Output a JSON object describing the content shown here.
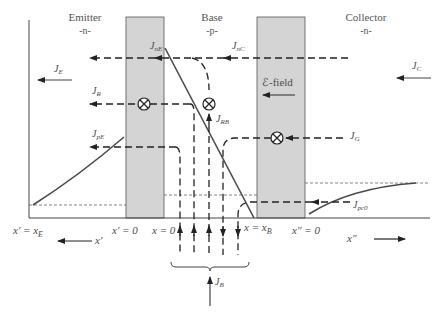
{
  "regions": {
    "emitter": {
      "name": "Emitter",
      "type": "-n-"
    },
    "base": {
      "name": "Base",
      "type": "-p-"
    },
    "collector": {
      "name": "Collector",
      "type": "-n-"
    }
  },
  "currents": {
    "JE": {
      "main": "J",
      "sub": "E"
    },
    "JnE": {
      "main": "J",
      "sub": "nE"
    },
    "JnC": {
      "main": "J",
      "sub": "nC"
    },
    "JC": {
      "main": "J",
      "sub": "C"
    },
    "JR": {
      "main": "J",
      "sub": "R"
    },
    "JRB": {
      "main": "J",
      "sub": "RB"
    },
    "JpE": {
      "main": "J",
      "sub": "pE"
    },
    "JG": {
      "main": "J",
      "sub": "G"
    },
    "Jpc0": {
      "main": "J",
      "sub": "pc0"
    },
    "JB": {
      "main": "J",
      "sub": "B"
    }
  },
  "field_label": "ℰ-field",
  "axis_labels": {
    "x_prime_eq_xE": "x′ = x",
    "x_prime_eq_xE_sub": "E",
    "x_prime_eq_0": "x′ = 0",
    "x_eq_0": "x = 0",
    "x_eq_xB": "x = x",
    "x_eq_xB_sub": "B",
    "x_dprime_eq_0": "x″ = 0",
    "x_prime_dir": "x′",
    "x_dprime_dir": "x″"
  },
  "colors": {
    "line": "#444444",
    "dash": "#222222",
    "depletion_fill": "#d4d4d4",
    "curve": "#4a4a4a",
    "text": "#4a4a4a"
  }
}
